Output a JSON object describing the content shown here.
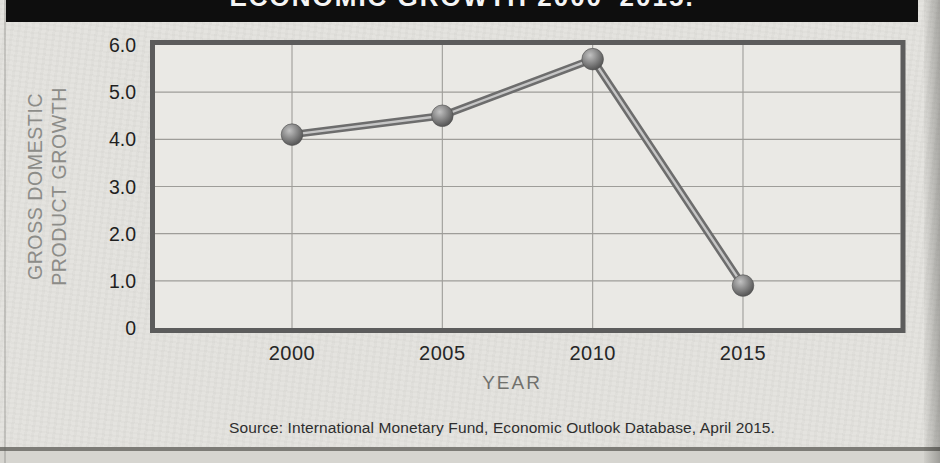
{
  "title_bar": {
    "clipped_title": "ECONOMIC GROWTH 2000–2015.",
    "visible_fragment": "2000–2015."
  },
  "chart_data": {
    "type": "line",
    "x": [
      2000,
      2005,
      2010,
      2015
    ],
    "xticks": [
      "2000",
      "2005",
      "2010",
      "2015"
    ],
    "values": [
      4.1,
      4.5,
      5.7,
      0.9
    ],
    "series_name": "gross-domestic-product-growth",
    "xlabel": "YEAR",
    "ylabel_line1": "GROSS DOMESTIC",
    "ylabel_line2": "PRODUCT GROWTH",
    "ylim": [
      0,
      6
    ],
    "ytick_values": [
      6,
      5,
      4,
      3,
      2,
      1,
      0
    ],
    "yticks": [
      "6.0",
      "5.0",
      "4.0",
      "3.0",
      "2.0",
      "1.0",
      "0"
    ],
    "grid": true,
    "legend": "none"
  },
  "source": {
    "text": "Source: International Monetary Fund, Economic Outlook Database, April 2015."
  },
  "colors": {
    "page_background": "#e4e3df",
    "plot_background": "#eae9e5",
    "title_bar_background": "#0e0e0e",
    "title_text": "#f5f5f5",
    "plot_border": "#5c5c5c",
    "gridline": "#9e9d99",
    "line_dark": "#6d6d6d",
    "line_highlight": "#c6c6c6",
    "marker_dark": "#4a4a4a",
    "marker_light": "#c2c2c2",
    "axis_title_gray": "#8c8c88",
    "tick_text": "#1f1f1f",
    "source_text": "#2e2e2e"
  }
}
